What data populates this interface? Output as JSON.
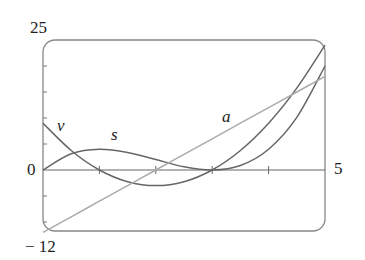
{
  "chart_data": {
    "type": "line",
    "title": "",
    "xlabel": "",
    "ylabel": "",
    "xlim": [
      0,
      5
    ],
    "ylim": [
      -12,
      25
    ],
    "x_tick_labels": [
      "0",
      "5"
    ],
    "y_tick_labels": [
      "25",
      "-12"
    ],
    "x_ticks": [
      1,
      2,
      3,
      4
    ],
    "grid": false,
    "legend": "inline curve labels",
    "x": [
      0,
      0.5,
      1,
      1.5,
      2,
      2.5,
      3,
      3.5,
      4,
      4.5,
      5
    ],
    "series": [
      {
        "name": "s",
        "label": "s",
        "color": "#666666",
        "values": [
          0,
          3.125,
          4,
          3.375,
          2,
          0.625,
          0,
          0.875,
          4,
          10.125,
          20
        ]
      },
      {
        "name": "v",
        "label": "v",
        "color": "#666666",
        "values": [
          9,
          3.75,
          0,
          -2.25,
          -3,
          -2.25,
          0,
          3.75,
          9,
          15.75,
          24
        ]
      },
      {
        "name": "a",
        "label": "a",
        "color": "#aaaaaa",
        "values": [
          -12,
          -9,
          -6,
          -3,
          0,
          3,
          6,
          9,
          12,
          15,
          18
        ]
      }
    ]
  },
  "labels": {
    "y_max": "25",
    "y_min": "− 12",
    "x_min": "0",
    "x_max": "5",
    "curve_s": "s",
    "curve_v": "v",
    "curve_a": "a"
  }
}
